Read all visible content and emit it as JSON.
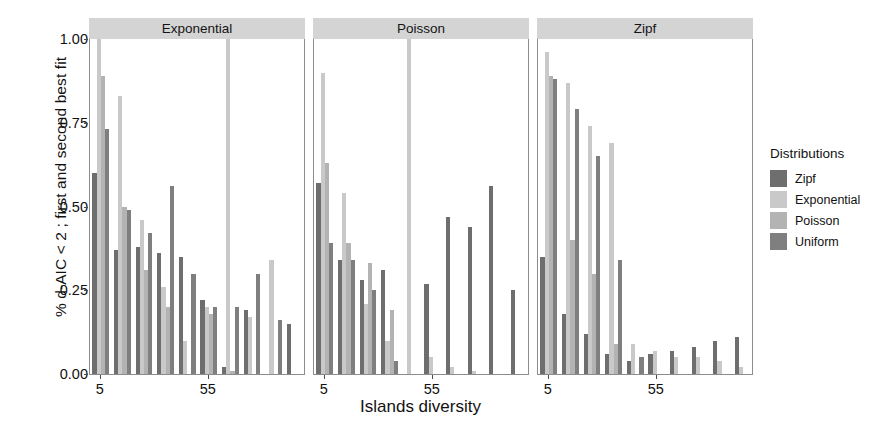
{
  "chart_data": {
    "type": "bar",
    "title": "",
    "xlabel": "Islands diversity",
    "ylabel": "% d-AIC < 2 ; first and second best fit",
    "ylim": [
      0,
      1.0
    ],
    "ytick_labels": [
      "0.00",
      "0.25",
      "0.50",
      "0.75",
      "1.00"
    ],
    "ytick_values": [
      0,
      0.25,
      0.5,
      0.75,
      1.0
    ],
    "xtick_labels": [
      "5",
      "55"
    ],
    "xtick_values": [
      5,
      55
    ],
    "grid": false,
    "legend_position": "right",
    "legend_title": "Distributions",
    "series_names": [
      "Zipf",
      "Exponential",
      "Poisson",
      "Uniform"
    ],
    "series_colors": [
      "#6e6e6e",
      "#c9c9c9",
      "#b3b3b3",
      "#7f7f7f"
    ],
    "facet_variable": "Simulated distribution",
    "facets": [
      {
        "label": "Exponential",
        "categories": [
          5,
          15,
          25,
          35,
          45,
          55,
          65,
          75,
          85,
          95
        ],
        "series": [
          {
            "name": "Zipf",
            "values": [
              0.6,
              0.37,
              0.38,
              0.36,
              0.35,
              0.22,
              0.02,
              0.19,
              0.0,
              0.15
            ]
          },
          {
            "name": "Exponential",
            "values": [
              1.0,
              0.83,
              0.46,
              0.26,
              0.1,
              0.2,
              1.0,
              0.17,
              0.34,
              0.0
            ]
          },
          {
            "name": "Poisson",
            "values": [
              0.89,
              0.5,
              0.31,
              0.2,
              0.0,
              0.18,
              0.01,
              0.0,
              0.0,
              0.0
            ]
          },
          {
            "name": "Uniform",
            "values": [
              0.73,
              0.49,
              0.42,
              0.56,
              0.3,
              0.2,
              0.2,
              0.3,
              0.16,
              0.0
            ]
          }
        ]
      },
      {
        "label": "Poisson",
        "categories": [
          5,
          15,
          25,
          35,
          45,
          55,
          65,
          75,
          85,
          95
        ],
        "series": [
          {
            "name": "Zipf",
            "values": [
              0.57,
              0.34,
              0.28,
              0.31,
              0.0,
              0.27,
              0.47,
              0.44,
              0.56,
              0.25
            ]
          },
          {
            "name": "Exponential",
            "values": [
              0.9,
              0.54,
              0.21,
              0.1,
              1.0,
              0.05,
              0.02,
              0.01,
              0.0,
              0.0
            ]
          },
          {
            "name": "Poisson",
            "values": [
              0.63,
              0.39,
              0.33,
              0.19,
              0.0,
              0.0,
              0.0,
              0.0,
              0.0,
              0.0
            ]
          },
          {
            "name": "Uniform",
            "values": [
              0.39,
              0.34,
              0.25,
              0.04,
              0.0,
              0.0,
              0.0,
              0.0,
              0.0,
              0.0
            ]
          }
        ]
      },
      {
        "label": "Zipf",
        "categories": [
          5,
          15,
          25,
          35,
          45,
          55,
          65,
          75,
          85,
          95
        ],
        "series": [
          {
            "name": "Zipf",
            "values": [
              0.35,
              0.18,
              0.12,
              0.06,
              0.04,
              0.06,
              0.07,
              0.08,
              0.1,
              0.11
            ]
          },
          {
            "name": "Exponential",
            "values": [
              0.96,
              0.87,
              0.74,
              0.69,
              0.09,
              0.07,
              0.05,
              0.05,
              0.04,
              0.02
            ]
          },
          {
            "name": "Poisson",
            "values": [
              0.89,
              0.4,
              0.3,
              0.09,
              0.0,
              0.0,
              0.0,
              0.0,
              0.0,
              0.0
            ]
          },
          {
            "name": "Uniform",
            "values": [
              0.88,
              0.79,
              0.65,
              0.34,
              0.05,
              0.0,
              0.0,
              0.0,
              0.0,
              0.0
            ]
          }
        ]
      }
    ]
  },
  "legend": {
    "title": "Distributions",
    "items": [
      {
        "label": "Zipf",
        "color": "#6e6e6e"
      },
      {
        "label": "Exponential",
        "color": "#c9c9c9"
      },
      {
        "label": "Poisson",
        "color": "#b3b3b3"
      },
      {
        "label": "Uniform",
        "color": "#7f7f7f"
      }
    ]
  },
  "axes": {
    "x_title": "Islands diversity",
    "y_title": "% d-AIC < 2 ; first and second best fit"
  }
}
